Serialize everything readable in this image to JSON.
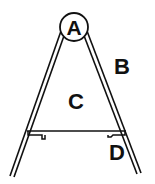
{
  "diagram": {
    "type": "a-frame-figure",
    "labels": {
      "A": "A",
      "B": "B",
      "C": "C",
      "D": "D"
    },
    "colors": {
      "stroke": "#111111",
      "background": "#ffffff"
    }
  }
}
